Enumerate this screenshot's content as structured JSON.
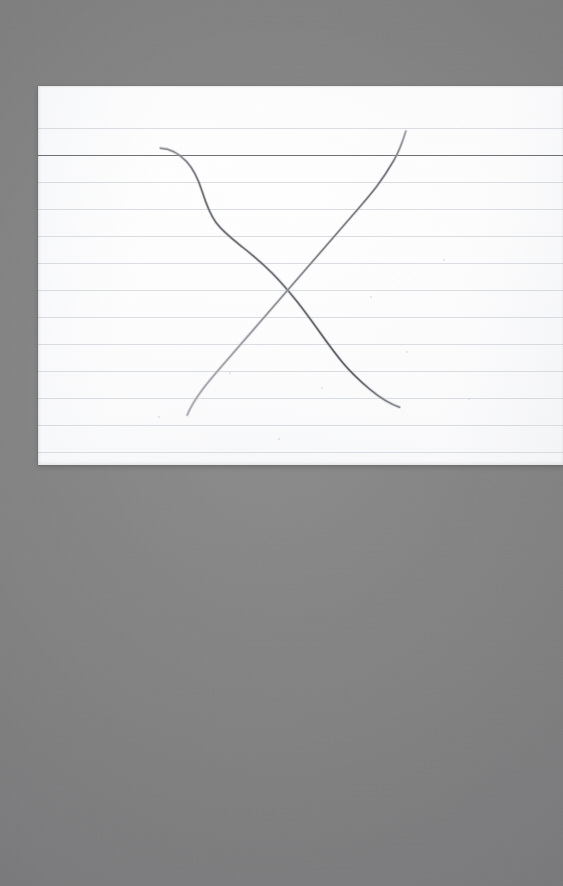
{
  "scene": {
    "width": 563,
    "height": 886,
    "description": "Photograph of a white ruled index card on a gray surface with a hand-drawn X in pencil",
    "backdrop_color": "#808082"
  },
  "card": {
    "name": "index-card",
    "paper_color": "#fcfcfc",
    "left": 38,
    "top": 86,
    "width": 525,
    "height": 379,
    "cropped_at_right_edge": true,
    "header_rule": {
      "label": "header-rule",
      "y": 69,
      "color": "#6e7076",
      "thickness": 1.4
    },
    "rule_color": "#d3d8de",
    "rule_spacing": 27,
    "rule_offsets": [
      42,
      96,
      123,
      150,
      177,
      204,
      231,
      258,
      285,
      312,
      339,
      366
    ],
    "specks": [
      {
        "x": 332,
        "y": 210,
        "size": 2
      },
      {
        "x": 191,
        "y": 286,
        "size": 2
      },
      {
        "x": 283,
        "y": 301,
        "size": 2
      },
      {
        "x": 120,
        "y": 330,
        "size": 2
      },
      {
        "x": 405,
        "y": 173,
        "size": 2
      },
      {
        "x": 368,
        "y": 265,
        "size": 2
      },
      {
        "x": 240,
        "y": 352,
        "size": 2
      },
      {
        "x": 430,
        "y": 312,
        "size": 2
      }
    ]
  },
  "drawing": {
    "name": "hand-drawn-x",
    "medium": "pencil",
    "stroke_color": "#6d6e74",
    "stroke_color_light": "#97999f",
    "stroke_width": 1.6,
    "crossing_point": {
      "x": 285,
      "y": 283
    },
    "strokes": [
      {
        "name": "stroke-top-left-to-bottom-right",
        "start": {
          "x": 160,
          "y": 148
        },
        "end": {
          "x": 400,
          "y": 407
        },
        "tone": "dark",
        "path": "M160.5,148.2 C170,148.6 179,153.5 186.5,161.5 C194,169.5 198.5,180 202,191 C205.5,202 209,213 216,222.5 C223,232 233,239.5 243,247.5 C253,255.5 263,264 272,273 C281,282 289,291.5 297,301.5 C305,311.5 312.5,322 320,332.5 C327.5,343 335,353.5 343,363 C351,372.5 360,381 369.5,389 C379,397 389,403.5 399.5,407.2"
      },
      {
        "name": "stroke-bottom-left-to-top-right",
        "start": {
          "x": 187,
          "y": 415
        },
        "end": {
          "x": 406,
          "y": 131
        },
        "tone": "light-to-dark",
        "path": "M187.2,415.0 C191,406 196.5,397.5 202.5,389.5 C208.5,381.5 215,374 221.5,366.5 C228,359 234.5,351.5 241,344 C247.5,336.5 254,329 260.5,321.5 C267,314 273.5,306.5 280,299 C286.5,291.5 293,284 299.5,276.5 C306,269 312.5,261.5 319,254 C325.5,246.5 332,239 338.5,231.5 C345,224 351.5,216.5 358,209 C364.5,201.5 371,194 377,186 C383,178 388.5,169.5 393.5,161 C398.5,152.5 402.5,142 405.8,131.2"
      }
    ]
  }
}
